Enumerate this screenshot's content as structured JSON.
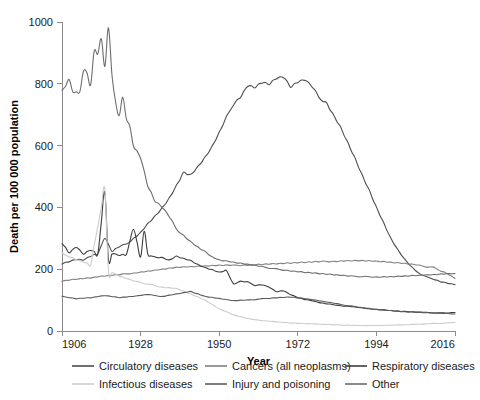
{
  "chart_data": {
    "type": "line",
    "title": "",
    "xlabel": "Year",
    "ylabel": "Death per 100 000 population",
    "xlim": [
      1906,
      2016
    ],
    "ylim": [
      0,
      1000
    ],
    "xticks": [
      1906,
      1928,
      1950,
      1972,
      1994,
      2016
    ],
    "yticks": [
      0,
      200,
      400,
      600,
      800,
      1000
    ],
    "grid": false,
    "legend_position": "bottom",
    "series": [
      {
        "name": "Circulatory diseases",
        "color": "#4d4d4d",
        "x": [
          1906,
          1908,
          1910,
          1912,
          1914,
          1916,
          1918,
          1920,
          1922,
          1924,
          1926,
          1928,
          1930,
          1932,
          1934,
          1936,
          1938,
          1940,
          1942,
          1944,
          1946,
          1948,
          1950,
          1952,
          1954,
          1956,
          1958,
          1960,
          1962,
          1964,
          1966,
          1968,
          1970,
          1972,
          1974,
          1976,
          1978,
          1980,
          1982,
          1984,
          1986,
          1988,
          1990,
          1992,
          1994,
          1996,
          1998,
          2000,
          2002,
          2004,
          2006,
          2008,
          2010,
          2012,
          2014,
          2016
        ],
        "values": [
          218,
          225,
          232,
          230,
          242,
          250,
          300,
          258,
          272,
          282,
          300,
          320,
          348,
          372,
          398,
          430,
          470,
          512,
          505,
          530,
          560,
          595,
          640,
          690,
          735,
          760,
          795,
          790,
          805,
          800,
          818,
          822,
          790,
          805,
          812,
          790,
          755,
          740,
          700,
          660,
          610,
          560,
          505,
          455,
          400,
          350,
          300,
          262,
          230,
          205,
          185,
          175,
          168,
          160,
          155,
          150
        ]
      },
      {
        "name": "Cancers (all neoplasms)",
        "color": "#808080",
        "x": [
          1906,
          1910,
          1914,
          1918,
          1922,
          1926,
          1930,
          1934,
          1938,
          1942,
          1946,
          1950,
          1954,
          1958,
          1962,
          1966,
          1970,
          1974,
          1978,
          1982,
          1986,
          1990,
          1994,
          1998,
          2002,
          2006,
          2010,
          2014,
          2016
        ],
        "values": [
          162,
          168,
          172,
          178,
          182,
          188,
          194,
          200,
          206,
          208,
          210,
          212,
          212,
          214,
          216,
          218,
          220,
          222,
          224,
          226,
          228,
          228,
          226,
          222,
          218,
          212,
          205,
          185,
          170
        ]
      },
      {
        "name": "Respiratory diseases",
        "color": "#3d3d3d",
        "x": [
          1906,
          1908,
          1910,
          1912,
          1914,
          1916,
          1918,
          1919,
          1920,
          1922,
          1924,
          1926,
          1928,
          1929,
          1930,
          1932,
          1934,
          1936,
          1938,
          1940,
          1942,
          1944,
          1946,
          1948,
          1950,
          1952,
          1954,
          1956,
          1958,
          1960,
          1962,
          1964,
          1966,
          1968,
          1970,
          1972,
          1974,
          1976,
          1978,
          1980,
          1984,
          1988,
          1992,
          1996,
          2000,
          2004,
          2008,
          2012,
          2016
        ],
        "values": [
          285,
          255,
          272,
          250,
          262,
          250,
          450,
          230,
          250,
          245,
          248,
          330,
          240,
          320,
          250,
          240,
          238,
          230,
          242,
          235,
          228,
          215,
          205,
          198,
          190,
          195,
          152,
          160,
          158,
          148,
          150,
          142,
          128,
          130,
          118,
          108,
          102,
          98,
          92,
          88,
          82,
          78,
          72,
          68,
          64,
          62,
          60,
          58,
          60
        ]
      },
      {
        "name": "Infectious diseases",
        "color": "#cccccc",
        "x": [
          1906,
          1910,
          1914,
          1918,
          1919,
          1922,
          1926,
          1930,
          1934,
          1938,
          1942,
          1946,
          1950,
          1954,
          1958,
          1962,
          1966,
          1970,
          1974,
          1978,
          1982,
          1986,
          1990,
          1994,
          1998,
          2002,
          2006,
          2010,
          2014,
          2016
        ],
        "values": [
          250,
          232,
          215,
          460,
          195,
          178,
          162,
          152,
          142,
          138,
          120,
          100,
          72,
          52,
          40,
          34,
          30,
          26,
          24,
          22,
          20,
          19,
          18,
          18,
          19,
          20,
          22,
          24,
          26,
          28
        ]
      },
      {
        "name": "Injury and poisoning",
        "color": "#5c5c5c",
        "x": [
          1906,
          1910,
          1914,
          1918,
          1922,
          1926,
          1930,
          1934,
          1938,
          1942,
          1946,
          1950,
          1954,
          1958,
          1962,
          1966,
          1970,
          1974,
          1978,
          1982,
          1986,
          1990,
          1994,
          1998,
          2002,
          2006,
          2010,
          2014,
          2016
        ],
        "values": [
          112,
          105,
          108,
          115,
          108,
          112,
          118,
          112,
          120,
          128,
          112,
          105,
          98,
          100,
          104,
          108,
          110,
          105,
          98,
          90,
          82,
          76,
          70,
          66,
          62,
          60,
          58,
          56,
          55
        ]
      },
      {
        "name": "Other",
        "color": "#6e6e6e",
        "x": [
          1906,
          1908,
          1909,
          1910,
          1911,
          1912,
          1913,
          1914,
          1915,
          1916,
          1917,
          1918,
          1919,
          1920,
          1921,
          1922,
          1923,
          1924,
          1925,
          1926,
          1928,
          1930,
          1932,
          1934,
          1936,
          1938,
          1940,
          1942,
          1944,
          1946,
          1948,
          1950,
          1954,
          1958,
          1962,
          1966,
          1970,
          1974,
          1978,
          1982,
          1986,
          1990,
          1994,
          1998,
          2002,
          2006,
          2010,
          2014,
          2016
        ],
        "values": [
          775,
          810,
          775,
          770,
          775,
          845,
          835,
          800,
          905,
          900,
          945,
          860,
          980,
          830,
          740,
          700,
          755,
          690,
          660,
          600,
          560,
          470,
          420,
          400,
          370,
          330,
          310,
          290,
          272,
          258,
          240,
          230,
          222,
          215,
          208,
          200,
          195,
          190,
          186,
          182,
          178,
          176,
          175,
          176,
          178,
          180,
          182,
          185,
          186
        ]
      }
    ]
  },
  "axes": {
    "x_tick_labels": [
      "1906",
      "1928",
      "1950",
      "1972",
      "1994",
      "2016"
    ],
    "y_tick_labels": [
      "0",
      "200",
      "400",
      "600",
      "800",
      "1000"
    ],
    "x_axis_title": "Year",
    "y_axis_title": "Death per 100 000 population"
  },
  "legend": {
    "rows": [
      [
        {
          "label": "Circulatory diseases",
          "color": "#4d4d4d"
        },
        {
          "label": "Cancers (all neoplasms)",
          "color": "#808080"
        },
        {
          "label": "Respiratory diseases",
          "color": "#3d3d3d"
        }
      ],
      [
        {
          "label": "Infectious diseases",
          "color": "#cccccc"
        },
        {
          "label": "Injury and poisoning",
          "color": "#5c5c5c"
        },
        {
          "label": "Other",
          "color": "#6e6e6e"
        }
      ]
    ]
  }
}
